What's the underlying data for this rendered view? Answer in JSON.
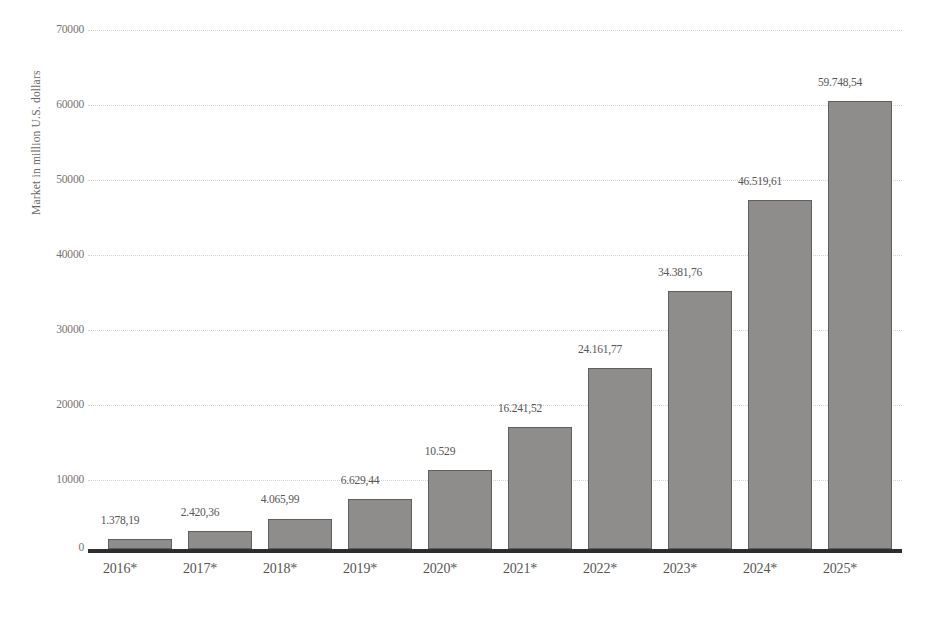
{
  "chart_data": {
    "type": "bar",
    "title": "",
    "subtitle": "",
    "xlabel": "",
    "ylabel": "Market in million U.S. dollars",
    "categories": [
      "2016*",
      "2017*",
      "2018*",
      "2019*",
      "2020*",
      "2021*",
      "2022*",
      "2023*",
      "2024*",
      "2025*"
    ],
    "values": [
      1378.19,
      2420.36,
      4065.99,
      6629.44,
      10529,
      16241.52,
      24161.77,
      34381.76,
      46519.61,
      59748.54
    ],
    "value_labels": [
      "1.378,19",
      "2.420,36",
      "4.065,99",
      "6.629,44",
      "10.529",
      "16.241,52",
      "24.161,77",
      "34.381,76",
      "46.519,61",
      "59.748,54"
    ],
    "ylim": [
      0,
      70000
    ],
    "y_ticks": [
      0,
      10000,
      20000,
      30000,
      40000,
      50000,
      60000,
      70000
    ],
    "y_tick_labels": [
      "0",
      "10000",
      "20000",
      "30000",
      "40000",
      "50000",
      "60000",
      "70000"
    ],
    "grid": true,
    "legend": "none",
    "series_color": "#8e8d8b",
    "bar_border_color": "#5f5e5c",
    "gridline_color": "#d3d2cf",
    "axis_color": "#2e2e2e"
  }
}
